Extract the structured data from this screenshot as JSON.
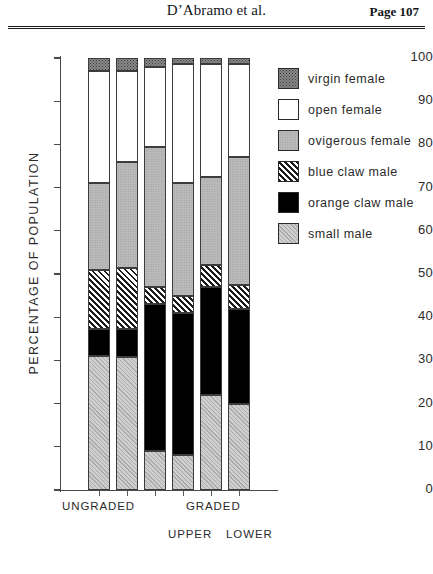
{
  "header": {
    "title": "D’Abramo et al.",
    "page_label": "Page 107"
  },
  "chart_data": {
    "type": "bar",
    "subtype": "stacked-percentage",
    "title": "",
    "xlabel": "",
    "ylabel": "PERCENTAGE OF POPULATION",
    "ylim": [
      0,
      100
    ],
    "yticks": [
      0,
      10,
      20,
      30,
      40,
      50,
      60,
      70,
      80,
      90,
      100
    ],
    "grid": false,
    "legend_position": "right",
    "categories": [
      "UNGRADED",
      "UNGRADED",
      "GRADED UPPER",
      "GRADED UPPER",
      "GRADED LOWER",
      "GRADED LOWER"
    ],
    "x_group_labels": [
      "UNGRADED",
      "GRADED"
    ],
    "x_sub_labels": [
      "UPPER",
      "LOWER"
    ],
    "series": [
      {
        "name": "small male",
        "values": [
          31.0,
          30.8,
          9.0,
          8.0,
          22.0,
          20.0
        ]
      },
      {
        "name": "orange claw male",
        "values": [
          6.3,
          6.5,
          34.0,
          33.0,
          25.0,
          22.0
        ]
      },
      {
        "name": "blue claw male",
        "values": [
          13.7,
          14.2,
          4.0,
          4.0,
          5.0,
          5.5
        ]
      },
      {
        "name": "ovigerous female",
        "values": [
          20.0,
          24.5,
          32.5,
          26.0,
          20.5,
          29.5
        ]
      },
      {
        "name": "open female",
        "values": [
          26.0,
          21.0,
          18.5,
          27.5,
          26.0,
          21.5
        ]
      },
      {
        "name": "virgin female",
        "values": [
          3.0,
          3.0,
          2.0,
          1.5,
          1.5,
          1.5
        ]
      }
    ],
    "stack_order_bottom_to_top": [
      "small male",
      "orange claw male",
      "blue claw male",
      "ovigerous female",
      "open female",
      "virgin female"
    ],
    "cumulative_tops": [
      [
        31.0,
        37.3,
        51.0,
        71.0,
        97.0,
        100.0
      ],
      [
        30.8,
        37.3,
        51.5,
        76.0,
        97.0,
        100.0
      ],
      [
        9.0,
        43.0,
        47.0,
        79.5,
        98.0,
        100.0
      ],
      [
        8.0,
        41.0,
        45.0,
        71.0,
        98.5,
        100.0
      ],
      [
        22.0,
        47.0,
        52.0,
        72.5,
        98.5,
        100.0
      ],
      [
        20.0,
        42.0,
        47.5,
        77.0,
        98.5,
        100.0
      ]
    ]
  },
  "legend": {
    "items": [
      {
        "label": "virgin female",
        "pattern": "dark-speckle",
        "color": "#8a8a8a"
      },
      {
        "label": "open female",
        "pattern": "white",
        "color": "#ffffff"
      },
      {
        "label": "ovigerous female",
        "pattern": "medium-gray",
        "color": "#b9b9b9"
      },
      {
        "label": "blue claw male",
        "pattern": "diagonal-hatch",
        "color": "#1c1c1c"
      },
      {
        "label": "orange claw male",
        "pattern": "solid-black",
        "color": "#000000"
      },
      {
        "label": "small male",
        "pattern": "light-gray-hatch",
        "color": "#c6c6c6"
      }
    ]
  },
  "axis": {
    "y_tick_labels": [
      "100",
      "90",
      "80",
      "70",
      "60",
      "50",
      "40",
      "30",
      "20",
      "10",
      "0"
    ]
  }
}
